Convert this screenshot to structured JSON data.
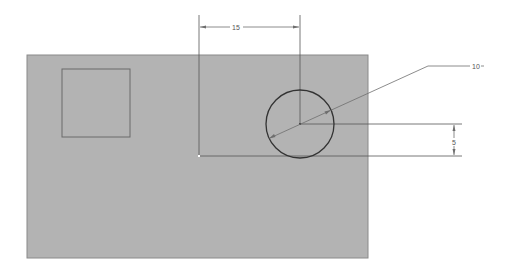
{
  "drawing": {
    "colors": {
      "background": "#ffffff",
      "plate_fill": "#b3b3b3",
      "plate_edge": "#8a8a8a",
      "sketch_line": "#555555",
      "circle_line": "#333333",
      "dim_line": "#6e6e6e"
    },
    "plate": {
      "x": 27,
      "y": 55,
      "width": 341,
      "height": 203
    },
    "square": {
      "x": 62,
      "y": 69,
      "width": 68,
      "height": 68
    },
    "circle": {
      "cx": 300,
      "cy": 124,
      "r": 34
    },
    "origin": {
      "x": 199,
      "y": 156
    },
    "dimensions": {
      "horizontal": {
        "label": "15",
        "y": 27,
        "x1": 199,
        "x2": 300,
        "label_x": 236
      },
      "vertical": {
        "label": "5",
        "x": 454,
        "y1": 124,
        "y2": 156,
        "label_y": 142
      },
      "diameter": {
        "label": "10",
        "leader_elbow_x": 428,
        "leader_y": 66,
        "label_x": 474
      }
    }
  }
}
